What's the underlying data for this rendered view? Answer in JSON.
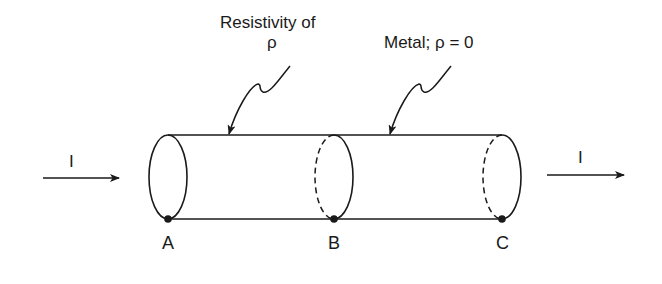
{
  "diagram": {
    "type": "two-segment cylindrical conductor",
    "labels": {
      "resistivity_line1": "Resistivity of",
      "resistivity_line2": "ρ",
      "metal": "Metal; ρ = 0",
      "current_in": "I",
      "current_out": "I",
      "point_a": "A",
      "point_b": "B",
      "point_c": "C"
    },
    "segments": [
      {
        "name": "resistive-segment",
        "from": "A",
        "to": "B",
        "property": "Resistivity of ρ"
      },
      {
        "name": "metal-segment",
        "from": "B",
        "to": "C",
        "property": "Metal; ρ = 0"
      }
    ],
    "colors": {
      "stroke": "#1a1a1a",
      "background": "#ffffff"
    }
  }
}
